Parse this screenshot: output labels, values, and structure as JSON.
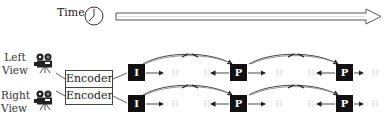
{
  "timeline": {
    "label": "Time",
    "icon": "clock-icon"
  },
  "views": [
    {
      "label_line1": "Left",
      "label_line2": "View",
      "icon": "video-camera-icon",
      "encoder_label": "Encoder",
      "frames": [
        "I",
        "B",
        "B",
        "P",
        "B",
        "B",
        "P",
        "B"
      ]
    },
    {
      "label_line1": "Right",
      "label_line2": "View",
      "icon": "video-camera-icon",
      "encoder_label": "Encoder",
      "frames": [
        "I",
        "B",
        "B",
        "P",
        "B",
        "B",
        "P",
        "B"
      ]
    }
  ],
  "colors": {
    "frame_fill": "#111111",
    "b_frame_text": "#eaeaea",
    "line": "#333333"
  }
}
